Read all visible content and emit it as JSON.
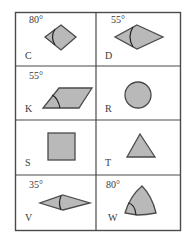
{
  "table": {
    "rows": 4,
    "cols": 2,
    "cells": [
      {
        "letter": "C",
        "angle": "80°",
        "shape": "rhombus"
      },
      {
        "letter": "D",
        "angle": "55°",
        "shape": "rhombus"
      },
      {
        "letter": "K",
        "angle": "55°",
        "shape": "parallelogram"
      },
      {
        "letter": "R",
        "angle": "",
        "shape": "circle"
      },
      {
        "letter": "S",
        "angle": "",
        "shape": "square"
      },
      {
        "letter": "T",
        "angle": "",
        "shape": "triangle"
      },
      {
        "letter": "V",
        "angle": "35°",
        "shape": "rhombus"
      },
      {
        "letter": "W",
        "angle": "80°",
        "shape": "curved-kite"
      }
    ]
  },
  "colors": {
    "shape_fill": "#b9b9b9",
    "stroke": "#4a4a4a"
  }
}
